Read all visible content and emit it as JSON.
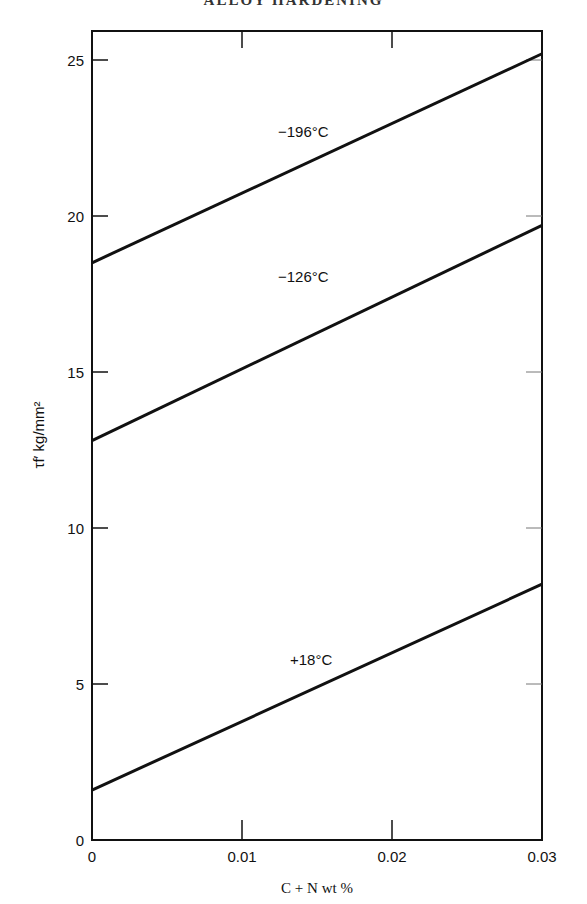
{
  "header_text": "ALLOY HARDENING",
  "chart_data": {
    "type": "line",
    "title": "",
    "xlabel": "C + N wt %",
    "ylabel": "τf′ kg/mm²",
    "xlim": [
      0,
      0.03
    ],
    "ylim": [
      0,
      26
    ],
    "x_ticks": [
      "0",
      "0.01",
      "0.02",
      "0.03"
    ],
    "y_ticks": [
      "0",
      "5",
      "10",
      "15",
      "20",
      "25"
    ],
    "grid": false,
    "series": [
      {
        "name": "−196°C",
        "x": [
          0,
          0.03
        ],
        "values": [
          18.5,
          25.2
        ]
      },
      {
        "name": "−126°C",
        "x": [
          0,
          0.03
        ],
        "values": [
          12.8,
          19.7
        ]
      },
      {
        "name": "+18°C",
        "x": [
          0,
          0.03
        ],
        "values": [
          1.6,
          8.2
        ]
      }
    ]
  }
}
